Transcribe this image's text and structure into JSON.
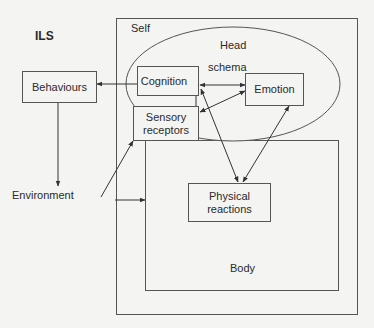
{
  "diagram": {
    "title": "ILS",
    "containers": {
      "self": {
        "label": "Self"
      },
      "head": {
        "label": "Head",
        "sublabel": "schema"
      },
      "body": {
        "label": "Body"
      }
    },
    "nodes": {
      "behaviours": {
        "label": "Behaviours"
      },
      "cognition": {
        "label": "Cognition"
      },
      "emotion": {
        "label": "Emotion"
      },
      "sensory": {
        "label": "Sensory receptors",
        "line1": "Sensory",
        "line2": "receptors"
      },
      "physical": {
        "label": "Physical reactions",
        "line1": "Physical",
        "line2": "reactions"
      },
      "environment": {
        "label": "Environment"
      }
    },
    "edges": [
      {
        "from": "Cognition",
        "to": "Behaviours",
        "type": "arrow"
      },
      {
        "from": "Behaviours",
        "to": "Environment",
        "type": "arrow"
      },
      {
        "from": "Environment",
        "to": "Sensory receptors",
        "type": "arrow"
      },
      {
        "from": "Environment",
        "to": "Body",
        "type": "arrow"
      },
      {
        "from": "Cognition",
        "to": "Sensory receptors",
        "type": "bidirectional"
      },
      {
        "from": "Cognition",
        "to": "Emotion",
        "type": "bidirectional"
      },
      {
        "from": "Sensory receptors",
        "to": "Emotion",
        "type": "bidirectional"
      },
      {
        "from": "Cognition",
        "to": "Physical reactions",
        "type": "bidirectional"
      },
      {
        "from": "Emotion",
        "to": "Physical reactions",
        "type": "bidirectional"
      }
    ],
    "colors": {
      "line": "#444444",
      "background": "#f4f4f2",
      "text": "#2a2a2a"
    }
  }
}
